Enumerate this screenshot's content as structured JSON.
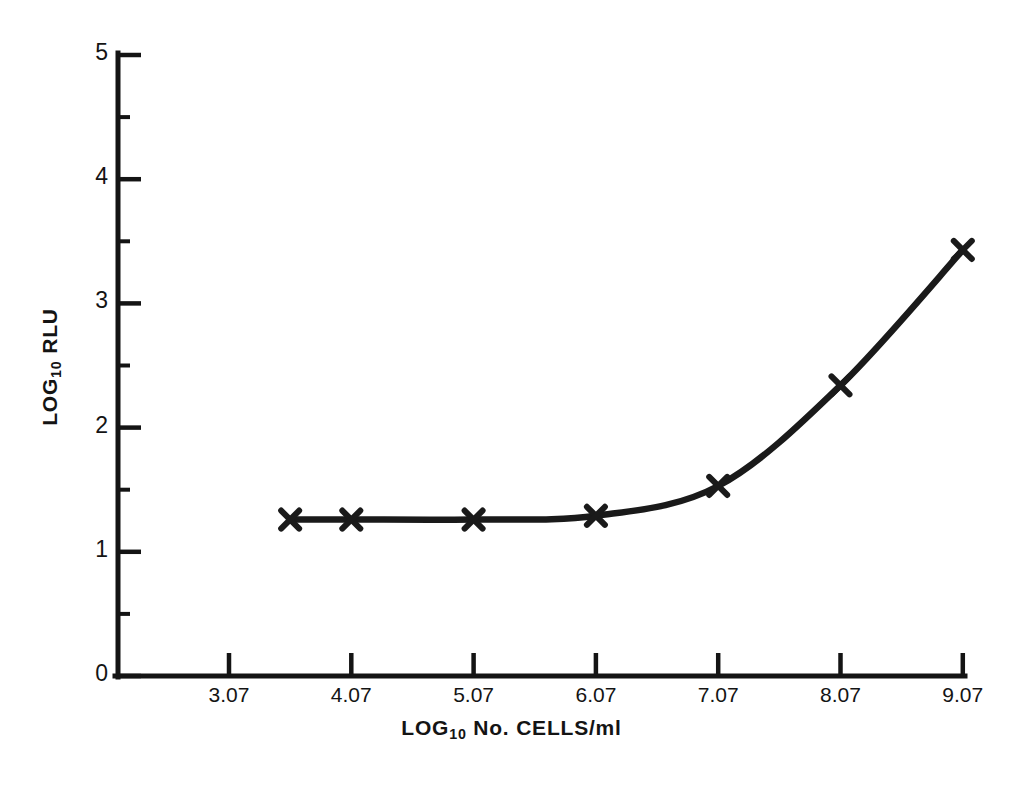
{
  "chart_data": {
    "type": "line",
    "title": "",
    "subtitle": "",
    "xlabel_parts": {
      "prefix": "LOG",
      "sub": "10",
      "suffix": " No. CELLS/ml"
    },
    "ylabel_parts": {
      "prefix": "LOG",
      "sub": "10",
      "suffix": "RLU"
    },
    "xlabel": "LOG10 No. CELLS/ml",
    "ylabel": "LOG10 RLU",
    "x": [
      3.57,
      4.07,
      5.07,
      6.07,
      7.07,
      8.07,
      9.07
    ],
    "values": [
      1.26,
      1.26,
      1.26,
      1.29,
      1.53,
      2.34,
      3.43
    ],
    "series": [
      {
        "name": "RLU response",
        "marker": "x",
        "points": [
          {
            "x": 3.57,
            "y": 1.26
          },
          {
            "x": 4.07,
            "y": 1.26
          },
          {
            "x": 5.07,
            "y": 1.26
          },
          {
            "x": 6.07,
            "y": 1.29
          },
          {
            "x": 7.07,
            "y": 1.53
          },
          {
            "x": 8.07,
            "y": 2.34
          },
          {
            "x": 9.07,
            "y": 3.43
          }
        ]
      }
    ],
    "xticks": [
      3.07,
      4.07,
      5.07,
      6.07,
      7.07,
      8.07,
      9.07
    ],
    "xtick_labels": [
      "3.07",
      "4.07",
      "5.07",
      "6.07",
      "7.07",
      "8.07",
      "9.07"
    ],
    "yticks": [
      0,
      1,
      2,
      3,
      4,
      5
    ],
    "ytick_labels": [
      "0",
      "1",
      "2",
      "3",
      "4",
      "5"
    ],
    "y_minor_ticks": [
      0.5,
      1.5,
      2.5,
      3.5,
      4.5
    ],
    "xlim": [
      2.57,
      9.07
    ],
    "ylim": [
      0,
      5
    ],
    "grid": false,
    "legend": null,
    "line_color": "#1a1a1a",
    "axis_color": "#141414",
    "background": "#ffffff"
  }
}
